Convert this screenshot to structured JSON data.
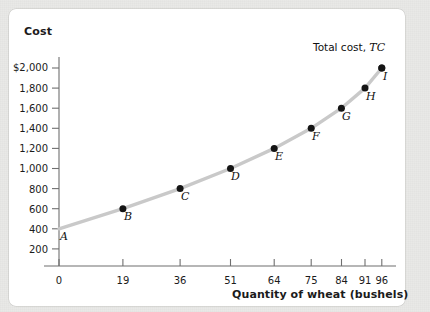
{
  "chart_data": {
    "type": "line",
    "title": "",
    "xlabel": "Quantity of wheat (bushels)",
    "ylabel": "Cost",
    "series_label": "Total cost,",
    "series_symbol": "TC",
    "xlim": [
      0,
      100
    ],
    "ylim": [
      0,
      2100
    ],
    "grid": false,
    "legend_position": "inside-top-right",
    "x": [
      0,
      19,
      36,
      51,
      64,
      75,
      84,
      91,
      96
    ],
    "values": [
      400,
      600,
      800,
      1000,
      1200,
      1400,
      1600,
      1800,
      2000
    ],
    "point_labels": [
      "A",
      "B",
      "C",
      "D",
      "E",
      "F",
      "G",
      "H",
      "I"
    ],
    "xticks": [
      "0",
      "19",
      "36",
      "51",
      "64",
      "75",
      "84",
      "91",
      "96"
    ],
    "xtick_values": [
      0,
      19,
      36,
      51,
      64,
      75,
      84,
      91,
      96
    ],
    "yticks": [
      "200",
      "400",
      "600",
      "800",
      "1,000",
      "1,200",
      "1,400",
      "1,600",
      "1,800",
      "$2,000"
    ],
    "ytick_values": [
      200,
      400,
      600,
      800,
      1000,
      1200,
      1400,
      1600,
      1800,
      2000
    ],
    "points": [
      {
        "label": "A",
        "x": 0,
        "y": 400
      },
      {
        "label": "B",
        "x": 19,
        "y": 600
      },
      {
        "label": "C",
        "x": 36,
        "y": 800
      },
      {
        "label": "D",
        "x": 51,
        "y": 1000
      },
      {
        "label": "E",
        "x": 64,
        "y": 1200
      },
      {
        "label": "F",
        "x": 75,
        "y": 1400
      },
      {
        "label": "G",
        "x": 84,
        "y": 1600
      },
      {
        "label": "H",
        "x": 91,
        "y": 1800
      },
      {
        "label": "I",
        "x": 96,
        "y": 2000
      }
    ],
    "colors": {
      "curve": "#c9c9c9",
      "marker": "#141414",
      "axis": "#6f6f6f",
      "text": "#1b1b1b",
      "panel": "#ffffff",
      "background": "#e9e9e7"
    }
  }
}
